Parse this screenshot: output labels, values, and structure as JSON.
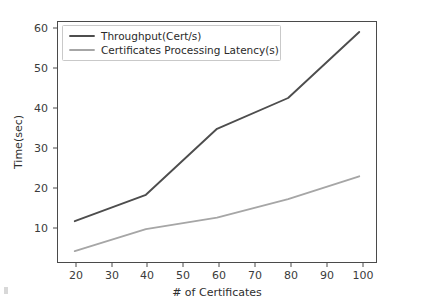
{
  "chart_data": {
    "type": "line",
    "title": "",
    "xlabel": "# of Certificates",
    "ylabel": "Time(sec)",
    "x": [
      20,
      40,
      60,
      80,
      100
    ],
    "xlim": [
      15,
      105
    ],
    "ylim": [
      7.5,
      62.5
    ],
    "xticks": [
      20,
      30,
      40,
      50,
      60,
      70,
      80,
      90,
      100
    ],
    "yticks": [
      10,
      20,
      30,
      40,
      50,
      60
    ],
    "grid": false,
    "legend_position": "upper left",
    "series": [
      {
        "name": "Throughput(Cert/s)",
        "values": [
          17,
          23,
          38,
          45,
          60
        ],
        "color": "#4d4d4d"
      },
      {
        "name": "Certificates Processing Latency(s)",
        "values": [
          10.2,
          15.2,
          17.8,
          22,
          27.2
        ],
        "color": "#a6a6a6"
      }
    ]
  },
  "axes": {
    "xlabel": "# of Certificates",
    "ylabel": "Time(sec)",
    "xtick_labels": [
      "20",
      "30",
      "40",
      "50",
      "60",
      "70",
      "80",
      "90",
      "100"
    ],
    "ytick_labels": [
      "10",
      "20",
      "30",
      "40",
      "50",
      "60"
    ]
  },
  "legend": {
    "entries": [
      {
        "label": "Throughput(Cert/s)",
        "color": "#4d4d4d"
      },
      {
        "label": "Certificates Processing Latency(s)",
        "color": "#a6a6a6"
      }
    ]
  },
  "colors": {
    "background": "#ffffff",
    "axis": "#4a4a4a",
    "text": "#2e2e2e",
    "series_primary": "#4d4d4d",
    "series_secondary": "#a6a6a6"
  }
}
